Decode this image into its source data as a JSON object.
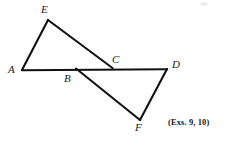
{
  "figure": {
    "name": "two-triangles-sharing-baseline",
    "background_color": "#ffffff",
    "stroke_color": "#111111",
    "caption": "(Exs. 9, 10)",
    "labels": {
      "a": "A",
      "b": "B",
      "c": "C",
      "d": "D",
      "e": "E",
      "f": "F"
    },
    "points": {
      "A": {
        "x": 22,
        "y": 70
      },
      "B": {
        "x": 76,
        "y": 68
      },
      "C": {
        "x": 112,
        "y": 67
      },
      "D": {
        "x": 167,
        "y": 69
      },
      "E": {
        "x": 48,
        "y": 20
      },
      "F": {
        "x": 140,
        "y": 120
      }
    },
    "label_positions": {
      "A": {
        "x": 8,
        "y": 64
      },
      "B": {
        "x": 64,
        "y": 73
      },
      "C": {
        "x": 112,
        "y": 54
      },
      "D": {
        "x": 172,
        "y": 59
      },
      "E": {
        "x": 41,
        "y": 4
      },
      "F": {
        "x": 135,
        "y": 122
      }
    },
    "segments": [
      {
        "name": "segment-AD",
        "from": "A",
        "to": "D"
      },
      {
        "name": "segment-AE",
        "from": "A",
        "to": "E"
      },
      {
        "name": "segment-EC",
        "from": "E",
        "to": "C"
      },
      {
        "name": "segment-BF",
        "from": "B",
        "to": "F"
      },
      {
        "name": "segment-FD",
        "from": "F",
        "to": "D"
      }
    ],
    "caption_position": {
      "x": 168,
      "y": 118
    }
  }
}
